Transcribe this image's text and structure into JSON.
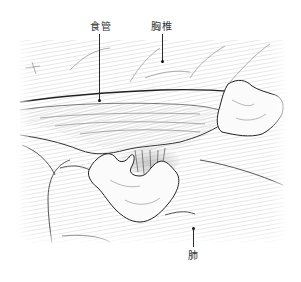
{
  "figure": {
    "labels": {
      "esophagus": "食管",
      "thoracic_vertebra": "胸椎",
      "lung": "肺"
    },
    "colors": {
      "background": "#ffffff",
      "hatch": "#d8d8d8",
      "outline": "#2a2a2a",
      "tissue_light": "#f6f6f6",
      "tissue_shade": "#c8c8c8",
      "label_text": "#333333"
    }
  }
}
